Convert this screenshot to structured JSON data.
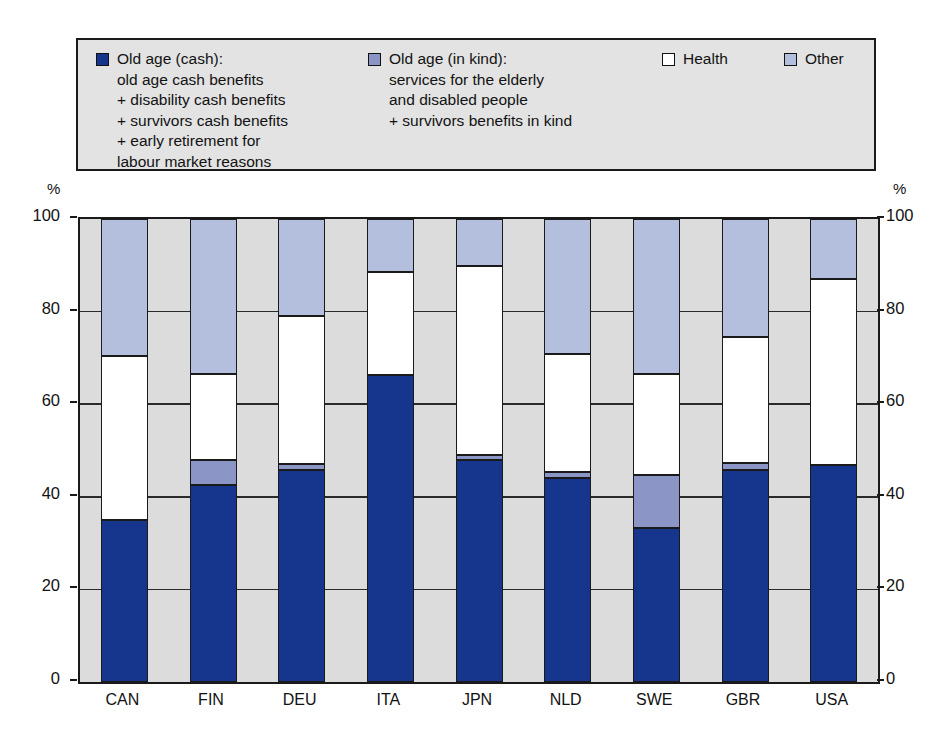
{
  "legend": {
    "items": [
      {
        "key": "cash",
        "swatch_color": "#16358c",
        "swatch_name": "legend-swatch-old-age-cash",
        "text": "Old age (cash):\nold age cash benefits\n+ disability cash benefits\n+ survivors cash benefits\n+ early retirement for\nlabour market reasons"
      },
      {
        "key": "kind",
        "swatch_color": "#8b96c6",
        "swatch_name": "legend-swatch-old-age-in-kind",
        "text": "Old age (in kind):\nservices for the elderly\nand disabled people\n+ survivors benefits in kind"
      },
      {
        "key": "health",
        "swatch_color": "#ffffff",
        "swatch_name": "legend-swatch-health",
        "text": "Health"
      },
      {
        "key": "other",
        "swatch_color": "#b4bedd",
        "swatch_name": "legend-swatch-other",
        "text": "Other"
      }
    ]
  },
  "axis": {
    "unit_left": "%",
    "unit_right": "%",
    "ticks": [
      "100",
      "80",
      "60",
      "40",
      "20",
      "0"
    ],
    "tick_values": [
      100,
      80,
      60,
      40,
      20,
      0
    ]
  },
  "chart_data": {
    "type": "bar",
    "stacked": true,
    "title": "",
    "xlabel": "",
    "ylabel": "%",
    "ylim": [
      0,
      100
    ],
    "grid": true,
    "legend_position": "top",
    "categories": [
      "CAN",
      "FIN",
      "DEU",
      "ITA",
      "JPN",
      "NLD",
      "SWE",
      "GBR",
      "USA"
    ],
    "series": [
      {
        "name": "Old age (cash)",
        "color": "#16358c",
        "values": [
          35.0,
          42.5,
          45.8,
          66.3,
          48.0,
          44.0,
          33.3,
          45.8,
          46.9
        ]
      },
      {
        "name": "Old age (in kind)",
        "color": "#8b96c6",
        "values": [
          0.0,
          5.5,
          1.2,
          0.0,
          1.0,
          1.4,
          11.4,
          1.5,
          0.0
        ]
      },
      {
        "name": "Health",
        "color": "#ffffff",
        "values": [
          35.5,
          18.5,
          32.0,
          22.2,
          40.9,
          25.4,
          21.9,
          27.2,
          40.1
        ]
      },
      {
        "name": "Other",
        "color": "#b4bedd",
        "values": [
          29.5,
          33.5,
          21.0,
          11.5,
          10.1,
          29.2,
          33.4,
          25.5,
          13.0
        ]
      }
    ]
  }
}
